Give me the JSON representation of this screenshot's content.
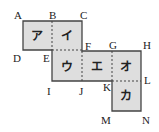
{
  "diagram": {
    "fill_color": "#dedede",
    "stroke_color": "#444444",
    "points": {
      "A": "A",
      "B": "B",
      "C": "C",
      "D": "D",
      "E": "E",
      "F": "F",
      "G": "G",
      "H": "H",
      "I": "I",
      "J": "J",
      "K": "K",
      "L": "L",
      "M": "M",
      "N": "N"
    },
    "cells": {
      "a": "ア",
      "i": "イ",
      "u": "ウ",
      "e": "エ",
      "o": "オ",
      "ka": "カ"
    }
  }
}
